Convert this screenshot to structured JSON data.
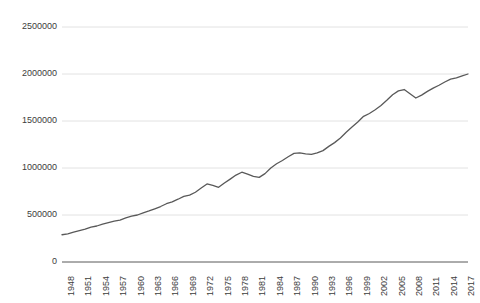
{
  "chart_data": {
    "type": "line",
    "title": "",
    "subtitle": "",
    "xlabel": "",
    "ylabel": "",
    "grid": true,
    "legend": false,
    "legend_position": "none",
    "xlim": [
      1948,
      2018
    ],
    "ylim": [
      0,
      2500000
    ],
    "yticks": [
      0,
      500000,
      1000000,
      1500000,
      2000000,
      2500000
    ],
    "ytick_labels": [
      "0",
      "500000",
      "1000000",
      "1500000",
      "2000000",
      "2500000"
    ],
    "xticks": [
      1948,
      1951,
      1954,
      1957,
      1960,
      1963,
      1966,
      1969,
      1972,
      1975,
      1978,
      1981,
      1984,
      1987,
      1990,
      1993,
      1996,
      1999,
      2002,
      2005,
      2008,
      2011,
      2014,
      2017
    ],
    "xtick_labels": [
      "1948",
      "1951",
      "1954",
      "1957",
      "1960",
      "1963",
      "1966",
      "1969",
      "1972",
      "1975",
      "1978",
      "1981",
      "1984",
      "1987",
      "1990",
      "1993",
      "1996",
      "1999",
      "2002",
      "2005",
      "2008",
      "2011",
      "2014",
      "2017"
    ],
    "line_color": "#595959",
    "grid_color": "#e2e2e2",
    "axis_color": "#595959",
    "x": [
      1948,
      1949,
      1950,
      1951,
      1952,
      1953,
      1954,
      1955,
      1956,
      1957,
      1958,
      1959,
      1960,
      1961,
      1962,
      1963,
      1964,
      1965,
      1966,
      1967,
      1968,
      1969,
      1970,
      1971,
      1972,
      1973,
      1974,
      1975,
      1976,
      1977,
      1978,
      1979,
      1980,
      1981,
      1982,
      1983,
      1984,
      1985,
      1986,
      1987,
      1988,
      1989,
      1990,
      1991,
      1992,
      1993,
      1994,
      1995,
      1996,
      1997,
      1998,
      1999,
      2000,
      2001,
      2002,
      2003,
      2004,
      2005,
      2006,
      2007,
      2008,
      2009,
      2010,
      2011,
      2012,
      2013,
      2014,
      2015,
      2016,
      2017,
      2018
    ],
    "values": [
      290000,
      300000,
      318000,
      335000,
      350000,
      372000,
      383000,
      404000,
      420000,
      436000,
      446000,
      470000,
      487000,
      500000,
      522000,
      543000,
      566000,
      590000,
      620000,
      640000,
      668000,
      698000,
      712000,
      742000,
      787000,
      830000,
      815000,
      795000,
      840000,
      882000,
      925000,
      955000,
      935000,
      910000,
      900000,
      940000,
      1000000,
      1045000,
      1080000,
      1120000,
      1155000,
      1160000,
      1150000,
      1145000,
      1160000,
      1185000,
      1230000,
      1270000,
      1320000,
      1380000,
      1435000,
      1490000,
      1550000,
      1580000,
      1620000,
      1665000,
      1720000,
      1780000,
      1820000,
      1835000,
      1790000,
      1745000,
      1775000,
      1815000,
      1850000,
      1880000,
      1915000,
      1945000,
      1960000,
      1980000,
      2000000
    ]
  }
}
